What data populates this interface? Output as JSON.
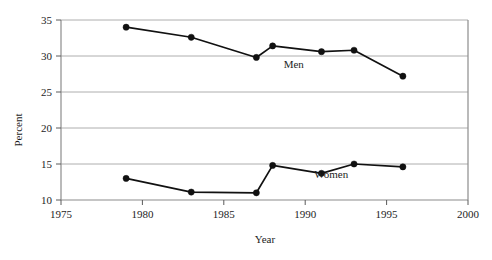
{
  "chart_data": {
    "type": "line",
    "title": "",
    "xlabel": "Year",
    "ylabel": "Percent",
    "xlim": [
      1975,
      2000
    ],
    "ylim": [
      10,
      35
    ],
    "xticks": [
      1975,
      1980,
      1985,
      1990,
      1995,
      2000
    ],
    "xtick_labels": [
      "1975",
      "1980",
      "1985",
      "1990",
      "1995",
      "2000"
    ],
    "yticks": [
      10,
      15,
      20,
      25,
      30,
      35
    ],
    "ytick_labels": [
      "10",
      "15",
      "20",
      "25",
      "30",
      "35"
    ],
    "grid": "horizontal",
    "legend_position": "inline-annotation",
    "marker": "filled-circle",
    "line_color": "#111111",
    "grid_color": "#9a9a9a",
    "axis_color": "#8c8c8c",
    "series": [
      {
        "name": "Men",
        "label": "Men",
        "label_x": 1989.3,
        "label_y": 28.3,
        "x": [
          1979,
          1983,
          1987,
          1988,
          1991,
          1993,
          1996
        ],
        "values": [
          34.0,
          32.6,
          29.8,
          31.4,
          30.6,
          30.8,
          27.2
        ]
      },
      {
        "name": "Women",
        "label": "Women",
        "label_x": 1991.6,
        "label_y": 13.0,
        "x": [
          1979,
          1983,
          1987,
          1988,
          1991,
          1993,
          1996
        ],
        "values": [
          13.0,
          11.1,
          11.0,
          14.8,
          13.7,
          15.0,
          14.6
        ]
      }
    ]
  }
}
